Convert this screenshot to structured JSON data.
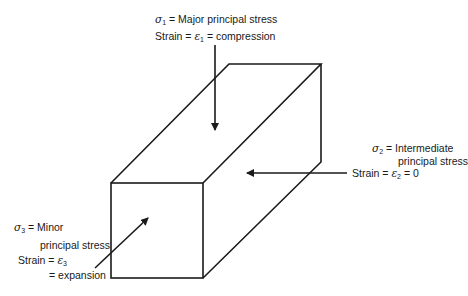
{
  "diagram": {
    "type": "principal-stress-block",
    "colors": {
      "line": "#1a1a1a",
      "background": "#ffffff"
    },
    "labels": {
      "sigma1": {
        "symbol": "σ",
        "subscript": "1",
        "text": "= Major principal stress",
        "strain_prefix": "Strain =",
        "strain_symbol": "ε",
        "strain_subscript": "1",
        "strain_text": "= compression"
      },
      "sigma2": {
        "symbol": "σ",
        "subscript": "2",
        "text": "= Intermediate",
        "line2": "principal stress",
        "strain_prefix": "Strain =",
        "strain_symbol": "ε",
        "strain_subscript": "2",
        "strain_text": "= 0"
      },
      "sigma3": {
        "symbol": "σ",
        "subscript": "3",
        "text": "= Minor",
        "line2": "principal stress",
        "strain_prefix": "Strain =",
        "strain_symbol": "ε",
        "strain_subscript": "3",
        "line4": "= expansion"
      }
    }
  }
}
